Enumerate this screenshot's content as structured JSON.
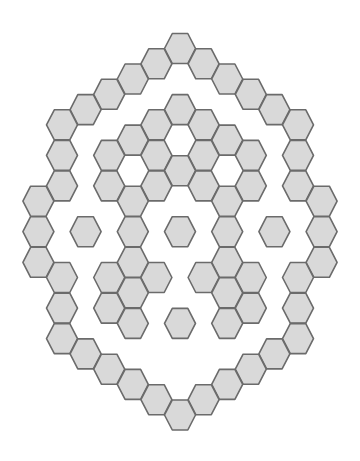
{
  "diagram": {
    "type": "hex-grid-pattern",
    "orientation": "flat-top",
    "fill": "#d9d9d9",
    "stroke": "#6b6b6b",
    "background": "#ffffff",
    "geometry": {
      "center_x": 180,
      "top_y": 48.5,
      "col_step": 23.6,
      "half_row_step": 15.27,
      "hex_width": 31,
      "hex_height": 30
    },
    "hexes": [
      {
        "c": 0,
        "r": 0
      },
      {
        "c": -1,
        "r": 1
      },
      {
        "c": 1,
        "r": 1
      },
      {
        "c": -2,
        "r": 2
      },
      {
        "c": 2,
        "r": 2
      },
      {
        "c": -3,
        "r": 3
      },
      {
        "c": 3,
        "r": 3
      },
      {
        "c": -4,
        "r": 4
      },
      {
        "c": 4,
        "r": 4
      },
      {
        "c": -5,
        "r": 5
      },
      {
        "c": 5,
        "r": 5
      },
      {
        "c": -5,
        "r": 7
      },
      {
        "c": 5,
        "r": 7
      },
      {
        "c": -5,
        "r": 9
      },
      {
        "c": 5,
        "r": 9
      },
      {
        "c": -6,
        "r": 10
      },
      {
        "c": 6,
        "r": 10
      },
      {
        "c": -6,
        "r": 12
      },
      {
        "c": 6,
        "r": 12
      },
      {
        "c": -6,
        "r": 14
      },
      {
        "c": 6,
        "r": 14
      },
      {
        "c": -5,
        "r": 15
      },
      {
        "c": 5,
        "r": 15
      },
      {
        "c": -5,
        "r": 17
      },
      {
        "c": 5,
        "r": 17
      },
      {
        "c": -5,
        "r": 19
      },
      {
        "c": 5,
        "r": 19
      },
      {
        "c": -4,
        "r": 20
      },
      {
        "c": 4,
        "r": 20
      },
      {
        "c": -3,
        "r": 21
      },
      {
        "c": 3,
        "r": 21
      },
      {
        "c": -2,
        "r": 22
      },
      {
        "c": 2,
        "r": 22
      },
      {
        "c": -1,
        "r": 23
      },
      {
        "c": 1,
        "r": 23
      },
      {
        "c": 0,
        "r": 24
      },
      {
        "c": 0,
        "r": 4
      },
      {
        "c": -1,
        "r": 5
      },
      {
        "c": 1,
        "r": 5
      },
      {
        "c": -2,
        "r": 6
      },
      {
        "c": 2,
        "r": 6
      },
      {
        "c": -3,
        "r": 7
      },
      {
        "c": -1,
        "r": 7
      },
      {
        "c": 1,
        "r": 7
      },
      {
        "c": 3,
        "r": 7
      },
      {
        "c": 0,
        "r": 8
      },
      {
        "c": -3,
        "r": 9
      },
      {
        "c": -1,
        "r": 9
      },
      {
        "c": 1,
        "r": 9
      },
      {
        "c": 3,
        "r": 9
      },
      {
        "c": -2,
        "r": 10
      },
      {
        "c": 2,
        "r": 10
      },
      {
        "c": -4,
        "r": 12
      },
      {
        "c": -2,
        "r": 12
      },
      {
        "c": 0,
        "r": 12
      },
      {
        "c": 2,
        "r": 12
      },
      {
        "c": 4,
        "r": 12
      },
      {
        "c": -2,
        "r": 14
      },
      {
        "c": 2,
        "r": 14
      },
      {
        "c": -3,
        "r": 15
      },
      {
        "c": -1,
        "r": 15
      },
      {
        "c": 1,
        "r": 15
      },
      {
        "c": 3,
        "r": 15
      },
      {
        "c": -2,
        "r": 16
      },
      {
        "c": 2,
        "r": 16
      },
      {
        "c": -3,
        "r": 17
      },
      {
        "c": 3,
        "r": 17
      },
      {
        "c": -2,
        "r": 18
      },
      {
        "c": 0,
        "r": 18
      },
      {
        "c": 2,
        "r": 18
      }
    ]
  }
}
